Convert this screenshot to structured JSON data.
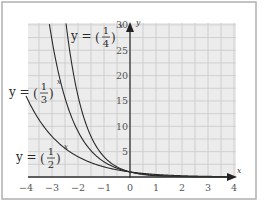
{
  "chart_data": {
    "type": "line",
    "title": "",
    "xlabel": "x",
    "ylabel": "y",
    "xlim": [
      -4,
      4
    ],
    "ylim": [
      0,
      30
    ],
    "grid": true,
    "x_ticks": [
      -4,
      -3,
      -2,
      -1,
      0,
      1,
      2,
      3,
      4
    ],
    "y_ticks": [
      5,
      10,
      15,
      20,
      25,
      30
    ],
    "series": [
      {
        "name": "y = (1/2)^x",
        "base": 0.5,
        "label": {
          "prefix": "y =",
          "num": "1",
          "den": "2",
          "exp": "x"
        }
      },
      {
        "name": "y = (1/3)^x",
        "base": 0.3333333,
        "label": {
          "prefix": "y =",
          "num": "1",
          "den": "3",
          "exp": "x"
        }
      },
      {
        "name": "y = (1/4)^x",
        "base": 0.25,
        "label": {
          "prefix": "y =",
          "num": "1",
          "den": "4",
          "exp": "x"
        }
      }
    ],
    "sample_points": {
      "y = (1/2)^x": [
        [
          -4,
          16
        ],
        [
          -3,
          8
        ],
        [
          -2,
          4
        ],
        [
          -1,
          2
        ],
        [
          0,
          1
        ],
        [
          1,
          0.5
        ],
        [
          2,
          0.25
        ],
        [
          3,
          0.125
        ],
        [
          4,
          0.0625
        ]
      ],
      "y = (1/3)^x": [
        [
          -3,
          27
        ],
        [
          -2,
          9
        ],
        [
          -1,
          3
        ],
        [
          0,
          1
        ],
        [
          1,
          0.333
        ],
        [
          2,
          0.111
        ],
        [
          3,
          0.037
        ],
        [
          4,
          0.012
        ]
      ],
      "y = (1/4)^x": [
        [
          -2.45,
          30
        ],
        [
          -2,
          16
        ],
        [
          -1,
          4
        ],
        [
          0,
          1
        ],
        [
          1,
          0.25
        ],
        [
          2,
          0.0625
        ],
        [
          3,
          0.016
        ],
        [
          4,
          0.004
        ]
      ]
    }
  },
  "layout": {
    "origin_px": [
      130,
      177
    ],
    "px_per_x": 26,
    "px_per_y": 5.07,
    "grid_x_step": 0.5,
    "grid_y_step": 2.5,
    "grid_box": [
      28,
      23,
      236,
      178
    ]
  }
}
